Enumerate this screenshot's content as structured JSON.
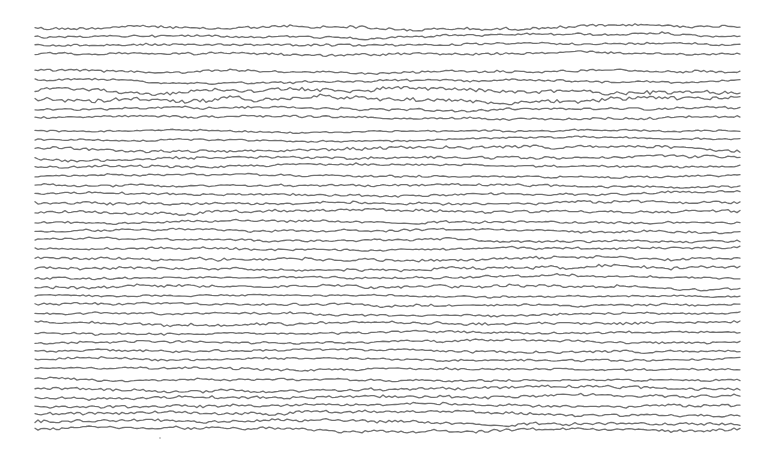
{
  "chart_data": {
    "type": "line",
    "title": "",
    "xlabel": "",
    "ylabel": "",
    "grid": false,
    "legend": null,
    "trace_count": 44,
    "x_range_px": [
      35,
      740
    ],
    "line_color": "#707070",
    "background": "#ffffff",
    "series_baselines_px": [
      27,
      36,
      45,
      54,
      71,
      80,
      90,
      99,
      109,
      118,
      131,
      140,
      149,
      158,
      167,
      176,
      185,
      194,
      203,
      212,
      222,
      231,
      240,
      249,
      259,
      268,
      277,
      286,
      296,
      305,
      314,
      323,
      333,
      342,
      351,
      360,
      370,
      379,
      388,
      397,
      406,
      414,
      422,
      430
    ],
    "series_amplitude_px": [
      2.5,
      2,
      2,
      2,
      2,
      2,
      3.5,
      3.5,
      2,
      2,
      1.5,
      1.5,
      2.5,
      2.5,
      2,
      2,
      2,
      2,
      2.5,
      2.5,
      2,
      2,
      2,
      2,
      2.5,
      2.5,
      2,
      2.5,
      1.5,
      2,
      2,
      2.5,
      2,
      2,
      2,
      2,
      2,
      2,
      2.5,
      2.5,
      2.5,
      2.5,
      2.5,
      2.5
    ]
  },
  "artifacts": {
    "stray_dot": {
      "x": 160,
      "y": 438
    }
  }
}
